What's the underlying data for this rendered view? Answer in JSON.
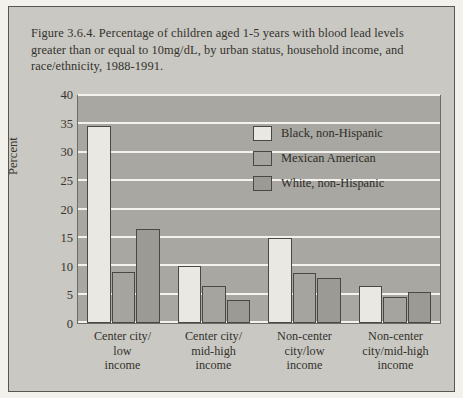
{
  "figure": {
    "caption": "Figure 3.6.4. Percentage of children aged 1-5 years with blood lead levels greater than or equal to 10mg/dL, by urban status, household income, and race/ethnicity, 1988-1991."
  },
  "colors": {
    "page_background": "#f2f1ec",
    "card_background": "#c9c8c2",
    "plot_background": "#a8a7a1",
    "gridline": "#f3f2ee",
    "outline": "#4a4842",
    "text": "#34322d",
    "series_black_non_hispanic": "#e9e8e3",
    "series_mexican_american": "#a5a49e",
    "series_white_non_hispanic": "#9b9a94"
  },
  "chart_data": {
    "type": "bar",
    "title": "Figure 3.6.4. Percentage of children aged 1-5 years with blood lead levels greater than or equal to 10mg/dL, by urban status, household income, and race/ethnicity, 1988-1991.",
    "xlabel": "",
    "ylabel": "Percent",
    "ylim": [
      0,
      40
    ],
    "yticks": [
      0,
      5,
      10,
      15,
      20,
      25,
      30,
      35,
      40
    ],
    "ytick_labels": [
      "0",
      "5",
      "10",
      "15",
      "20",
      "25",
      "30",
      "35",
      "40"
    ],
    "grid": true,
    "legend_position": "upper right inside plot",
    "categories": [
      "Center city/ low income",
      "Center city/ mid-high income",
      "Non-center city/low income",
      "Non-center city/mid-high income"
    ],
    "category_lines": [
      [
        "Center city/",
        "low",
        "income"
      ],
      [
        "Center city/",
        "mid-high",
        "income"
      ],
      [
        "Non-center",
        "city/low",
        "income"
      ],
      [
        "Non-center",
        "city/mid-high",
        "income"
      ]
    ],
    "series": [
      {
        "name": "Black, non-Hispanic",
        "color": "#e9e8e3",
        "values": [
          34.8,
          10.0,
          15.0,
          6.5
        ]
      },
      {
        "name": "Mexican American",
        "color": "#a5a49e",
        "values": [
          9.0,
          6.5,
          8.8,
          4.5
        ]
      },
      {
        "name": "White, non-Hispanic",
        "color": "#9b9a94",
        "values": [
          16.5,
          4.0,
          8.0,
          5.5
        ]
      }
    ]
  }
}
